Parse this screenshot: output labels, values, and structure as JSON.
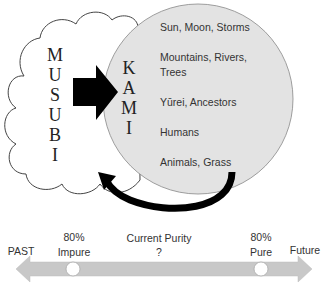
{
  "diagram": {
    "cloud": {
      "label_letters": [
        "M",
        "U",
        "S",
        "U",
        "B",
        "I"
      ],
      "label": "MUSUBI"
    },
    "circle": {
      "label_letters": [
        "K",
        "A",
        "M",
        "I"
      ],
      "label": "KAMI",
      "fill": "#e3e3e3",
      "items": [
        {
          "line1": "Sun, Moon, Storms",
          "line2": ""
        },
        {
          "line1": "Mountains, Rivers,",
          "line2": "Trees"
        },
        {
          "line1": "Yūrei, Ancestors",
          "line2": ""
        },
        {
          "line1": "Humans",
          "line2": ""
        },
        {
          "line1": "Animals, Grass",
          "line2": ""
        }
      ]
    },
    "arrow_color": "#000000"
  },
  "timeline": {
    "left_end": "PAST",
    "right_end": "Future",
    "markers": [
      {
        "line1": "80%",
        "line2": "Impure"
      },
      {
        "line1": "Current Purity",
        "line2": "?"
      },
      {
        "line1": "80%",
        "line2": "Pure"
      }
    ],
    "bar_color": "#c8c8c8"
  }
}
